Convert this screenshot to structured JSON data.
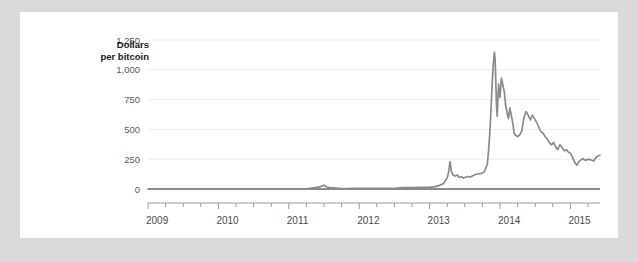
{
  "chart_data": {
    "type": "line",
    "title": "",
    "subtitle": "",
    "ylabel": "Dollars per bitcoin",
    "ylabel_line1": "Dollars",
    "ylabel_line2": "per bitcoin",
    "xlabel": "",
    "ylim": [
      0,
      1250
    ],
    "xlim": [
      2009.0,
      2015.42
    ],
    "grid": true,
    "legend": false,
    "legend_position": "none",
    "yticks": [
      0,
      250,
      500,
      750,
      1000,
      1250
    ],
    "ytick_labels": [
      "0",
      "250",
      "500",
      "750",
      "1,000",
      "1,250"
    ],
    "xticks": [
      2009,
      2010,
      2011,
      2012,
      2013,
      2014,
      2015
    ],
    "xtick_labels": [
      "2009",
      "2010",
      "2011",
      "2012",
      "2013",
      "2014",
      "2015"
    ],
    "minor_xtick_interval": 0.25,
    "line_color": "#8a8a8a",
    "grid_color": "#ededed",
    "series": [
      {
        "name": "Bitcoin price",
        "x": [
          2009.0,
          2009.25,
          2009.5,
          2009.75,
          2010.0,
          2010.25,
          2010.5,
          2010.62,
          2010.75,
          2010.88,
          2011.0,
          2011.12,
          2011.25,
          2011.33,
          2011.42,
          2011.46,
          2011.5,
          2011.54,
          2011.58,
          2011.67,
          2011.75,
          2011.83,
          2011.92,
          2012.0,
          2012.12,
          2012.25,
          2012.37,
          2012.5,
          2012.62,
          2012.75,
          2012.87,
          2013.0,
          2013.08,
          2013.15,
          2013.2,
          2013.25,
          2013.27,
          2013.29,
          2013.31,
          2013.33,
          2013.36,
          2013.39,
          2013.42,
          2013.45,
          2013.48,
          2013.5,
          2013.54,
          2013.58,
          2013.62,
          2013.66,
          2013.7,
          2013.74,
          2013.78,
          2013.8,
          2013.82,
          2013.84,
          2013.86,
          2013.88,
          2013.9,
          2013.92,
          2013.93,
          2013.94,
          2013.95,
          2013.96,
          2013.97,
          2013.98,
          2013.99,
          2014.0,
          2014.02,
          2014.04,
          2014.06,
          2014.08,
          2014.1,
          2014.12,
          2014.14,
          2014.16,
          2014.18,
          2014.2,
          2014.22,
          2014.25,
          2014.28,
          2014.31,
          2014.34,
          2014.37,
          2014.4,
          2014.43,
          2014.46,
          2014.49,
          2014.52,
          2014.55,
          2014.58,
          2014.61,
          2014.64,
          2014.67,
          2014.7,
          2014.73,
          2014.76,
          2014.79,
          2014.82,
          2014.85,
          2014.88,
          2014.91,
          2014.94,
          2014.97,
          2015.0,
          2015.03,
          2015.06,
          2015.09,
          2015.12,
          2015.15,
          2015.18,
          2015.21,
          2015.25,
          2015.29,
          2015.33,
          2015.37,
          2015.42
        ],
        "values": [
          0,
          0,
          0,
          0,
          0,
          0,
          0.07,
          0.06,
          0.2,
          0.25,
          0.3,
          0.9,
          1.0,
          8.0,
          15.0,
          22.0,
          31.0,
          17.0,
          11.0,
          7.0,
          4.0,
          3.0,
          4.5,
          5.5,
          5.0,
          5.0,
          5.2,
          6.5,
          11.0,
          12.5,
          13.5,
          13.5,
          20.0,
          33.0,
          47.0,
          93.0,
          140.0,
          230.0,
          145.0,
          120.0,
          108.0,
          118.0,
          98.0,
          103.0,
          92.0,
          97.0,
          105.0,
          100.0,
          113.0,
          124.0,
          128.0,
          131.0,
          145.0,
          180.0,
          210.0,
          340.0,
          520.0,
          780.0,
          1010.0,
          1147.0,
          1090.0,
          900.0,
          700.0,
          610.0,
          760.0,
          880.0,
          800.0,
          770.0,
          930.0,
          870.0,
          820.0,
          700.0,
          640.0,
          590.0,
          680.0,
          620.0,
          560.0,
          470.0,
          450.0,
          440.0,
          455.0,
          490.0,
          600.0,
          650.0,
          620.0,
          580.0,
          620.0,
          590.0,
          560.0,
          520.0,
          480.0,
          470.0,
          440.0,
          420.0,
          390.0,
          370.0,
          390.0,
          355.0,
          330.0,
          370.0,
          350.0,
          320.0,
          330.0,
          310.0,
          300.0,
          265.0,
          225.0,
          200.0,
          230.0,
          245.0,
          255.0,
          240.0,
          250.0,
          245.0,
          235.0,
          270.0,
          283.0
        ]
      }
    ]
  }
}
